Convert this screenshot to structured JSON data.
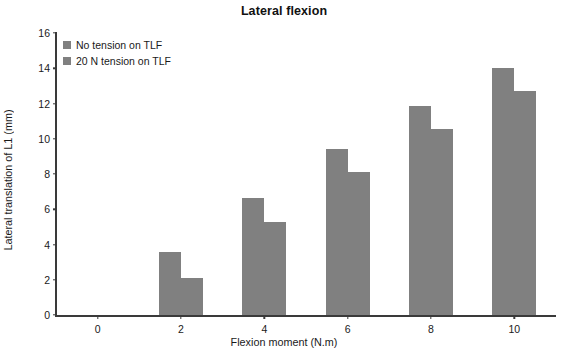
{
  "chart_data": {
    "type": "bar",
    "title": "Lateral flexion",
    "xlabel": "Flexion moment (N.m)",
    "ylabel": "Lateral translation of L1 (mm)",
    "categories": [
      "0",
      "2",
      "4",
      "6",
      "8",
      "10"
    ],
    "series": [
      {
        "name": "No tension on TLF",
        "color": "#808080",
        "values": [
          0,
          3.6,
          6.65,
          9.4,
          11.85,
          14.0
        ]
      },
      {
        "name": "20 N tension on TLF",
        "color": "#808080",
        "values": [
          0,
          2.1,
          5.3,
          8.1,
          10.55,
          12.7
        ]
      }
    ],
    "ylim": [
      0,
      16
    ],
    "yticks": [
      "0",
      "2",
      "4",
      "6",
      "8",
      "10",
      "12",
      "14",
      "16"
    ],
    "grid": false,
    "legend_position": "top-left",
    "bar_color": "#808080",
    "axis_color": "#3a3a3a"
  }
}
